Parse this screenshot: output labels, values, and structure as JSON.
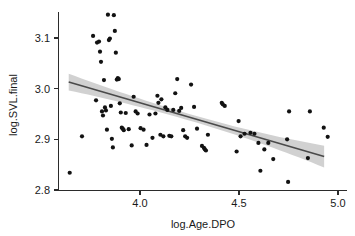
{
  "chart_data": {
    "type": "scatter",
    "title": "",
    "xlabel": "log.Age.DPO",
    "ylabel": "log.SVL.final",
    "xlim": [
      3.6,
      5.03
    ],
    "ylim": [
      2.795,
      3.155
    ],
    "xticks": [
      4.0,
      4.5,
      5.0
    ],
    "xtick_labels": [
      "4.0",
      "4.5",
      "5.0"
    ],
    "yticks": [
      2.8,
      2.9,
      3.0,
      3.1
    ],
    "ytick_labels": [
      "2.8",
      "2.9",
      "3.0",
      "3.1"
    ],
    "grid": false,
    "legend": false,
    "point_color": "#121212",
    "line_color": "#4a4a4a",
    "band_color": "#c9c9c9",
    "axis_color": "#2b2b2b",
    "background": "#ffffff",
    "fit": {
      "type": "linear-regression",
      "x_start": 3.64,
      "x_end": 4.93,
      "y_start": 3.013,
      "y_end": 2.866,
      "slope": -0.114,
      "intercept": 3.428,
      "band_label": "95% confidence interval",
      "band_half_width_start": 0.0165,
      "band_half_width_mid": 0.0065,
      "band_half_width_end": 0.0215
    },
    "x": [
      3.645,
      3.707,
      3.763,
      3.778,
      3.783,
      3.793,
      3.798,
      3.803,
      3.808,
      3.813,
      3.818,
      3.823,
      3.828,
      3.833,
      3.838,
      3.843,
      3.848,
      3.853,
      3.858,
      3.863,
      3.868,
      3.873,
      3.878,
      3.883,
      3.888,
      3.893,
      3.898,
      3.903,
      3.908,
      3.913,
      3.918,
      3.928,
      3.943,
      3.958,
      3.968,
      3.978,
      3.988,
      4.003,
      4.018,
      4.033,
      4.048,
      4.063,
      4.078,
      4.088,
      4.093,
      4.103,
      4.108,
      4.118,
      4.128,
      4.138,
      4.148,
      4.158,
      4.168,
      4.178,
      4.188,
      4.198,
      4.208,
      4.218,
      4.228,
      4.238,
      4.258,
      4.273,
      4.288,
      4.313,
      4.323,
      4.328,
      4.333,
      4.343,
      4.413,
      4.418,
      4.428,
      4.488,
      4.498,
      4.508,
      4.528,
      4.558,
      4.578,
      4.598,
      4.608,
      4.628,
      4.648,
      4.673,
      4.743,
      4.748,
      4.753,
      4.848,
      4.858,
      4.928,
      4.948
    ],
    "y": [
      2.834,
      2.906,
      3.104,
      2.977,
      3.091,
      3.093,
      3.073,
      3.053,
      2.955,
      2.947,
      3.017,
      2.963,
      2.957,
      2.919,
      3.146,
      3.096,
      3.099,
      2.966,
      2.901,
      2.884,
      3.145,
      3.114,
      3.071,
      3.018,
      3.021,
      3.019,
      2.971,
      2.953,
      2.923,
      2.921,
      2.918,
      2.952,
      2.92,
      2.888,
      2.984,
      2.955,
      2.951,
      2.922,
      2.919,
      2.889,
      2.949,
      2.903,
      2.951,
      2.986,
      2.972,
      2.909,
      2.979,
      2.906,
      2.963,
      2.958,
      2.907,
      2.906,
      2.958,
      2.991,
      3.019,
      2.956,
      2.962,
      2.918,
      2.906,
      2.903,
      3.008,
      2.964,
      2.921,
      2.887,
      2.883,
      2.88,
      2.878,
      2.909,
      2.972,
      2.969,
      2.966,
      2.876,
      2.936,
      2.906,
      2.911,
      2.913,
      2.911,
      2.893,
      2.838,
      2.88,
      2.893,
      2.861,
      2.9,
      2.816,
      2.955,
      2.863,
      2.955,
      2.923,
      2.905
    ]
  }
}
